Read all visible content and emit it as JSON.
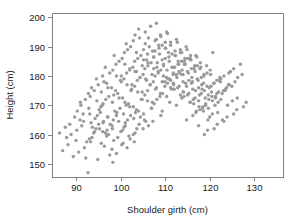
{
  "chart_data": {
    "type": "scatter",
    "title": "",
    "xlabel": "Shoulder girth (cm)",
    "ylabel": "Height (cm)",
    "xlim": [
      84.5,
      136.5
    ],
    "ylim": [
      145.5,
      201.5
    ],
    "xticks": [
      90,
      100,
      110,
      120,
      130
    ],
    "xtick_labels": [
      "90",
      "100",
      "110",
      "120",
      "130"
    ],
    "yticks": [
      150,
      160,
      170,
      180,
      190,
      200
    ],
    "ytick_labels": [
      "150",
      "160",
      "170",
      "180",
      "190",
      "200"
    ],
    "grid": false,
    "legend": null,
    "point_color": "#9a9a9a",
    "point_radius": 1.7,
    "frame_color": "#808080",
    "n_points": 507,
    "x": [
      88.8,
      92.1,
      93.2,
      94.1,
      95.0,
      86.2,
      90.5,
      91.8,
      93.5,
      95.2,
      87.5,
      89.9,
      92.6,
      94.8,
      96.3,
      88.1,
      91.2,
      93.9,
      96.0,
      97.5,
      86.9,
      90.1,
      92.9,
      95.6,
      97.1,
      89.3,
      91.6,
      94.4,
      96.8,
      98.2,
      87.8,
      90.8,
      93.0,
      95.9,
      98.0,
      88.5,
      92.3,
      94.7,
      97.2,
      99.0,
      90.2,
      93.6,
      96.1,
      98.4,
      100.2,
      91.0,
      94.2,
      96.9,
      99.3,
      101.0,
      89.6,
      92.8,
      95.4,
      98.1,
      100.5,
      90.9,
      93.3,
      96.5,
      99.0,
      101.4,
      92.0,
      95.1,
      97.6,
      100.0,
      102.1,
      93.1,
      95.8,
      98.3,
      100.7,
      102.8,
      91.5,
      94.6,
      97.0,
      99.5,
      101.8,
      92.7,
      95.5,
      98.0,
      100.4,
      103.0,
      94.0,
      96.6,
      99.1,
      101.5,
      103.6,
      93.4,
      96.0,
      98.6,
      101.0,
      103.2,
      94.9,
      97.3,
      99.8,
      102.2,
      104.1,
      95.6,
      98.1,
      100.6,
      102.9,
      105.0,
      96.2,
      98.8,
      101.2,
      103.5,
      105.6,
      94.5,
      97.1,
      99.6,
      102.0,
      104.4,
      95.9,
      98.4,
      100.9,
      103.3,
      105.3,
      96.8,
      99.3,
      101.7,
      104.0,
      106.2,
      97.5,
      100.1,
      102.4,
      104.8,
      106.9,
      98.2,
      100.7,
      103.1,
      105.4,
      107.5,
      96.5,
      99.0,
      101.4,
      103.8,
      106.0,
      97.9,
      100.4,
      102.8,
      105.1,
      107.2,
      98.9,
      101.3,
      103.7,
      106.0,
      108.1,
      99.6,
      102.0,
      104.3,
      106.6,
      108.8,
      100.3,
      102.7,
      105.0,
      107.3,
      109.4,
      98.5,
      100.9,
      103.2,
      105.6,
      107.8,
      99.9,
      102.3,
      104.6,
      106.9,
      109.0,
      100.8,
      103.1,
      105.4,
      107.7,
      109.9,
      101.5,
      103.8,
      106.1,
      108.4,
      110.5,
      102.2,
      104.5,
      106.8,
      109.0,
      111.2,
      100.1,
      102.5,
      104.8,
      107.1,
      109.3,
      101.2,
      103.5,
      105.8,
      108.1,
      110.3,
      102.8,
      105.1,
      107.4,
      109.6,
      111.8,
      103.5,
      105.8,
      108.0,
      110.3,
      112.5,
      104.2,
      106.4,
      108.7,
      110.9,
      113.1,
      102.0,
      104.3,
      106.6,
      108.9,
      111.0,
      103.2,
      105.5,
      107.7,
      110.0,
      112.1,
      104.8,
      107.0,
      109.3,
      111.5,
      113.7,
      105.5,
      107.7,
      110.0,
      112.2,
      114.3,
      106.1,
      108.4,
      110.6,
      112.8,
      115.0,
      104.0,
      106.2,
      108.5,
      110.7,
      112.9,
      105.1,
      107.4,
      109.6,
      111.8,
      114.0,
      106.7,
      108.9,
      111.2,
      113.4,
      115.6,
      107.4,
      109.6,
      111.8,
      114.0,
      116.2,
      108.0,
      110.3,
      112.5,
      114.7,
      116.9,
      106.0,
      108.2,
      110.4,
      112.6,
      114.8,
      107.1,
      109.3,
      111.5,
      113.7,
      115.9,
      108.6,
      110.8,
      113.0,
      115.2,
      117.4,
      109.3,
      111.5,
      113.7,
      115.9,
      118.1,
      110.0,
      112.2,
      114.4,
      116.6,
      118.7,
      108.0,
      110.1,
      112.3,
      114.5,
      116.7,
      109.0,
      111.2,
      113.4,
      115.6,
      117.8,
      110.5,
      112.7,
      114.9,
      117.1,
      119.3,
      111.2,
      113.4,
      115.6,
      117.8,
      120.0,
      111.9,
      114.1,
      116.3,
      118.5,
      120.6,
      109.9,
      112.0,
      114.2,
      116.4,
      118.6,
      111.0,
      113.1,
      115.3,
      117.5,
      119.7,
      112.5,
      114.6,
      116.8,
      119.0,
      121.2,
      113.2,
      115.3,
      117.5,
      119.7,
      121.9,
      113.8,
      116.0,
      118.2,
      120.4,
      122.5,
      111.8,
      114.0,
      116.1,
      118.3,
      120.5,
      112.9,
      115.0,
      117.2,
      119.4,
      121.6,
      114.3,
      116.5,
      118.7,
      120.9,
      123.1,
      115.0,
      117.2,
      119.4,
      121.6,
      123.8,
      115.7,
      117.9,
      120.1,
      122.3,
      124.4,
      113.7,
      115.8,
      118.0,
      120.2,
      122.4,
      114.8,
      116.9,
      119.1,
      121.3,
      123.5,
      116.2,
      118.4,
      120.6,
      122.8,
      125.0,
      117.0,
      119.1,
      121.3,
      123.5,
      125.7,
      117.6,
      119.8,
      122.0,
      124.2,
      126.3,
      115.6,
      117.7,
      119.9,
      122.1,
      124.3,
      116.7,
      118.8,
      121.0,
      123.2,
      125.4,
      118.1,
      120.3,
      122.5,
      124.7,
      126.9,
      118.8,
      121.0,
      123.2,
      125.4,
      127.6,
      119.5,
      121.7,
      123.9,
      126.1,
      128.2,
      117.5,
      119.6,
      121.8,
      124.0,
      126.2,
      118.6,
      120.7,
      122.9,
      125.1,
      127.3,
      120.0,
      122.2,
      124.4,
      126.6,
      128.8,
      120.7,
      122.9,
      125.1,
      127.3,
      129.5,
      121.4,
      123.6,
      125.8,
      128.0,
      130.1,
      119.4,
      121.5,
      123.7,
      125.9,
      128.1,
      120.5,
      122.6,
      124.8,
      127.0,
      129.2,
      121.9,
      124.1,
      126.3,
      128.5,
      130.7,
      122.6,
      124.8,
      127.0,
      129.2,
      131.4,
      123.3,
      125.5,
      127.7,
      129.9,
      132.0,
      121.3,
      123.4,
      125.6,
      127.8,
      130.0,
      122.4,
      124.5,
      126.7,
      128.9,
      131.1,
      123.8,
      126.0,
      128.2,
      130.4,
      132.6,
      124.5,
      126.7,
      128.9,
      131.1,
      133.3,
      125.2,
      127.4,
      129.6,
      131.8,
      134.0,
      134.8,
      131.6,
      129.8,
      127.2,
      125.4
    ],
    "y": [
      160.0,
      152.0,
      157.5,
      161.0,
      163.5,
      160.5,
      154.0,
      155.5,
      159.0,
      162.0,
      162.5,
      158.0,
      147.0,
      151.5,
      156.0,
      156.5,
      163.0,
      160.5,
      164.0,
      153.0,
      154.5,
      161.5,
      158.5,
      157.0,
      166.0,
      152.5,
      164.5,
      162.0,
      159.5,
      150.5,
      159.0,
      165.0,
      167.0,
      161.0,
      155.0,
      163.5,
      157.5,
      166.5,
      160.0,
      153.5,
      168.0,
      162.5,
      164.5,
      158.0,
      156.5,
      170.0,
      165.5,
      161.5,
      159.0,
      163.0,
      166.0,
      169.0,
      167.5,
      162.0,
      157.0,
      171.0,
      164.0,
      160.5,
      166.5,
      155.5,
      172.0,
      168.5,
      163.5,
      161.0,
      158.5,
      173.0,
      170.0,
      165.0,
      162.5,
      160.0,
      167.0,
      171.5,
      166.0,
      164.5,
      159.5,
      174.0,
      169.5,
      163.0,
      161.5,
      157.5,
      175.0,
      172.0,
      167.5,
      165.0,
      162.0,
      176.0,
      170.5,
      168.0,
      164.0,
      160.5,
      177.0,
      173.0,
      169.0,
      166.5,
      163.5,
      174.5,
      171.0,
      167.0,
      165.5,
      162.0,
      178.0,
      175.0,
      170.0,
      168.5,
      164.5,
      179.0,
      176.0,
      172.5,
      169.5,
      166.0,
      180.0,
      173.5,
      171.0,
      167.5,
      165.0,
      177.5,
      174.0,
      170.5,
      168.0,
      163.0,
      181.0,
      178.0,
      175.5,
      172.0,
      169.0,
      182.0,
      179.0,
      176.5,
      173.5,
      170.5,
      183.0,
      180.0,
      177.0,
      174.5,
      171.5,
      176.0,
      172.5,
      169.5,
      167.0,
      164.5,
      184.0,
      181.0,
      178.5,
      175.0,
      172.0,
      185.0,
      182.0,
      179.5,
      177.0,
      173.0,
      186.0,
      183.0,
      180.5,
      178.0,
      174.0,
      187.0,
      184.0,
      181.5,
      179.0,
      175.5,
      178.5,
      175.0,
      172.0,
      169.0,
      166.5,
      188.0,
      185.0,
      182.5,
      180.0,
      176.5,
      189.0,
      186.0,
      183.5,
      181.0,
      177.5,
      190.0,
      187.0,
      184.5,
      182.0,
      178.5,
      180.0,
      177.0,
      174.5,
      171.0,
      168.0,
      191.0,
      188.0,
      185.5,
      183.0,
      179.5,
      192.0,
      189.0,
      186.5,
      184.0,
      180.5,
      181.5,
      178.5,
      176.0,
      173.0,
      170.0,
      193.0,
      190.0,
      187.5,
      185.0,
      181.5,
      182.5,
      179.5,
      177.0,
      174.0,
      171.0,
      194.0,
      191.0,
      188.5,
      186.0,
      183.0,
      183.5,
      180.5,
      178.0,
      175.5,
      172.5,
      195.0,
      192.0,
      189.5,
      187.0,
      184.0,
      184.5,
      181.5,
      179.0,
      176.0,
      173.5,
      196.0,
      193.0,
      190.5,
      188.0,
      185.0,
      185.5,
      182.5,
      180.0,
      177.5,
      174.5,
      197.0,
      194.0,
      191.5,
      189.0,
      186.0,
      186.5,
      183.5,
      181.0,
      178.0,
      175.5,
      198.0,
      195.0,
      192.5,
      190.0,
      187.0,
      187.5,
      184.5,
      182.0,
      179.5,
      176.5,
      188.5,
      185.5,
      183.0,
      180.5,
      177.5,
      189.5,
      186.5,
      184.0,
      181.0,
      178.5,
      190.5,
      187.5,
      185.0,
      182.5,
      179.5,
      191.5,
      188.5,
      186.0,
      183.5,
      180.5,
      192.5,
      189.5,
      187.0,
      184.0,
      181.5,
      193.5,
      190.5,
      188.0,
      185.5,
      182.5,
      194.5,
      191.5,
      189.0,
      186.5,
      183.5,
      176.0,
      173.5,
      171.0,
      168.5,
      166.0,
      177.0,
      174.5,
      172.0,
      169.5,
      167.0,
      178.0,
      175.5,
      173.0,
      170.5,
      168.0,
      179.0,
      176.5,
      174.0,
      171.5,
      169.0,
      180.5,
      177.5,
      175.0,
      172.5,
      170.0,
      181.0,
      178.5,
      176.0,
      173.5,
      171.0,
      182.0,
      179.5,
      177.0,
      174.5,
      172.0,
      183.0,
      180.5,
      178.0,
      175.5,
      173.0,
      184.0,
      181.5,
      179.0,
      176.5,
      174.0,
      185.0,
      182.5,
      180.0,
      177.5,
      175.0,
      186.0,
      183.5,
      181.0,
      178.5,
      176.0,
      187.0,
      184.5,
      182.0,
      179.5,
      177.0,
      188.0,
      185.5,
      183.0,
      180.5,
      178.0,
      165.0,
      167.5,
      170.0,
      172.5,
      175.0,
      166.5,
      169.0,
      171.5,
      174.0,
      176.5,
      168.0,
      170.5,
      173.0,
      175.5,
      178.0,
      169.5,
      172.0,
      174.5,
      177.0,
      179.5,
      171.0,
      173.5,
      176.0,
      178.5,
      181.0,
      172.5,
      175.0,
      177.5,
      180.0,
      182.5,
      174.0,
      176.5,
      179.0,
      181.5,
      184.0,
      160.0,
      162.0,
      164.5,
      167.0,
      169.5,
      161.5,
      163.5,
      166.0,
      168.5,
      171.0,
      163.0,
      165.0,
      167.5,
      170.0,
      172.5,
      177.5,
      188.0,
      165.0,
      171.5,
      180.5
    ]
  },
  "figure": {
    "width": 297,
    "height": 222,
    "plot_left": 52,
    "plot_right": 283,
    "plot_top": 13,
    "plot_bottom": 177
  }
}
